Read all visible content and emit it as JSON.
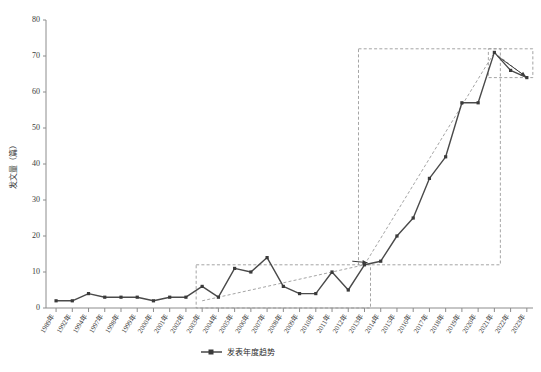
{
  "chart_data": {
    "type": "line",
    "title": "",
    "xlabel": "",
    "ylabel": "发文量（篇）",
    "ylim": [
      0,
      80
    ],
    "yticks": [
      0,
      10,
      20,
      30,
      40,
      50,
      60,
      70,
      80
    ],
    "grid": false,
    "legend_position": "bottom-center",
    "legend": [
      "发表年度趋势"
    ],
    "categories": [
      "1989年",
      "1992年",
      "1994年",
      "1997年",
      "1998年",
      "1999年",
      "2000年",
      "2001年",
      "2002年",
      "2003年",
      "2004年",
      "2005年",
      "2006年",
      "2007年",
      "2008年",
      "2009年",
      "2010年",
      "2011年",
      "2012年",
      "2013年",
      "2014年",
      "2015年",
      "2016年",
      "2017年",
      "2018年",
      "2019年",
      "2020年",
      "2021年",
      "2022年",
      "2023年"
    ],
    "series": [
      {
        "name": "发表年度趋势",
        "values": [
          2,
          2,
          4,
          3,
          3,
          3,
          2,
          3,
          3,
          6,
          3,
          11,
          10,
          14,
          6,
          4,
          4,
          10,
          5,
          12,
          13,
          20,
          25,
          36,
          42,
          57,
          57,
          71,
          66,
          64
        ]
      }
    ],
    "annotations": {
      "boxes": [
        {
          "name": "mid-period-box",
          "x_start": "2003年",
          "x_end": "2013年",
          "y_low": 0,
          "y_high": 12
        },
        {
          "name": "growth-period-box",
          "x_start": "2013年",
          "x_end": "2021年",
          "y_low": 12,
          "y_high": 72
        },
        {
          "name": "decline-period-box",
          "x_start": "2021年",
          "x_end": "2023年",
          "y_low": 64,
          "y_high": 72
        }
      ],
      "trend_lines": [
        {
          "name": "mid-period-trend",
          "from": [
            "2003年",
            2
          ],
          "to": [
            "2013年",
            12
          ]
        },
        {
          "name": "growth-period-trend",
          "from": [
            "2013年",
            12
          ],
          "to": [
            "2021年",
            71
          ]
        },
        {
          "name": "decline-trend",
          "from": [
            "2021年",
            71
          ],
          "to": [
            "2023年",
            64
          ]
        }
      ],
      "arrows": [
        {
          "name": "into-growth-arrow"
        },
        {
          "name": "decline-arrow"
        }
      ]
    }
  },
  "legend": {
    "label": "发表年度趋势"
  },
  "axes": {
    "y_title": "发文量（篇）"
  }
}
